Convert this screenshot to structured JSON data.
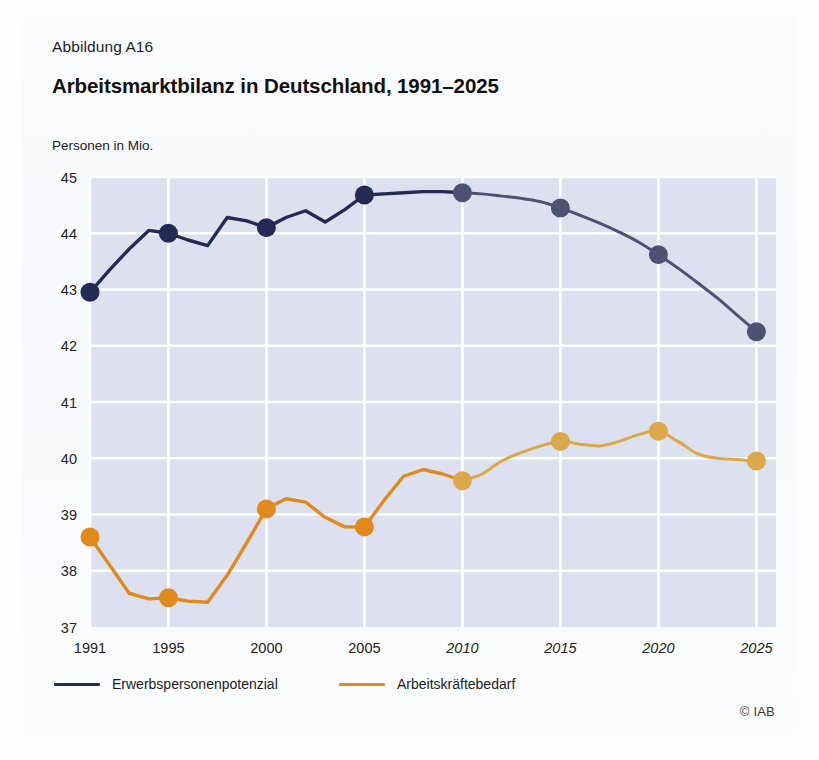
{
  "figure": {
    "number_label": "Abbildung A16",
    "title": "Arbeitsmarktbilanz in Deutschland, 1991–2025",
    "unit_label": "Personen in Mio.",
    "credit": "© IAB"
  },
  "legend": {
    "position": "bottom-left",
    "items": [
      {
        "label": "Erwerbspersonenpotenzial",
        "color": "#242a52"
      },
      {
        "label": "Arbeitskräftebedarf",
        "color": "#e08a1e"
      }
    ]
  },
  "colors": {
    "navy_observed": "#242a52",
    "navy_projected": "#4d5272",
    "orange_observed": "#e08a1e",
    "orange_projected": "#dba84b",
    "plot_background": "#dde1ef",
    "gridline": "#ffffff",
    "page_background": "#fdfdfe",
    "text": "#232323"
  },
  "chart_data": {
    "type": "line",
    "title": "Arbeitsmarktbilanz in Deutschland, 1991–2025",
    "xlabel": "",
    "ylabel": "Personen in Mio.",
    "xlim": [
      1991,
      2026
    ],
    "ylim": [
      37,
      45
    ],
    "yticks": [
      37,
      38,
      39,
      40,
      41,
      42,
      43,
      44,
      45
    ],
    "xticks": [
      1991,
      1995,
      2000,
      2005,
      2010,
      2015,
      2020,
      2025
    ],
    "xticks_italic": [
      2010,
      2015,
      2020,
      2025
    ],
    "grid": true,
    "marker_years": [
      1991,
      1995,
      2000,
      2005,
      2010,
      2015,
      2020,
      2025
    ],
    "projection_starts": 2010,
    "x": [
      1991,
      1992,
      1993,
      1994,
      1995,
      1996,
      1997,
      1998,
      1999,
      2000,
      2001,
      2002,
      2003,
      2004,
      2005,
      2006,
      2007,
      2008,
      2009,
      2010,
      2011,
      2012,
      2013,
      2014,
      2015,
      2016,
      2017,
      2018,
      2019,
      2020,
      2021,
      2022,
      2023,
      2024,
      2025
    ],
    "series": [
      {
        "name": "Erwerbspersonenpotenzial",
        "color": "#242a52",
        "values": [
          42.95,
          43.35,
          43.72,
          44.05,
          44.0,
          43.88,
          43.78,
          44.28,
          44.22,
          44.1,
          44.28,
          44.4,
          44.2,
          44.42,
          44.68,
          44.7,
          44.72,
          44.74,
          44.74,
          44.72,
          44.7,
          44.66,
          44.62,
          44.56,
          44.45,
          44.32,
          44.18,
          44.02,
          43.84,
          43.62,
          43.38,
          43.12,
          42.85,
          42.55,
          42.25
        ]
      },
      {
        "name": "Arbeitskräftebedarf",
        "color": "#e08a1e",
        "values": [
          38.6,
          38.1,
          37.6,
          37.5,
          37.52,
          37.46,
          37.44,
          37.92,
          38.5,
          39.1,
          39.28,
          39.22,
          38.95,
          38.78,
          38.78,
          39.25,
          39.68,
          39.8,
          39.72,
          39.6,
          39.72,
          39.95,
          40.1,
          40.22,
          40.3,
          40.25,
          40.22,
          40.3,
          40.42,
          40.48,
          40.3,
          40.08,
          40.0,
          39.98,
          39.95
        ]
      }
    ]
  }
}
